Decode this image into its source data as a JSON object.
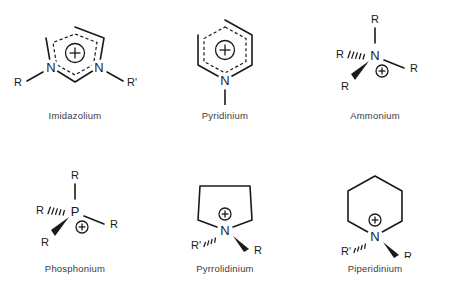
{
  "figure": {
    "background_color": "#ffffff",
    "line_color": "#1a1a1a",
    "caption_color": "#3b3b3b",
    "charge_symbol": "+",
    "columns": 3,
    "rows": 2
  },
  "structures": [
    {
      "id": "imidazolium",
      "caption": "Imidazolium",
      "ring": "five-membered aromatic",
      "heteroatoms": [
        "N",
        "N"
      ],
      "atom_labels": [
        "N",
        "N"
      ],
      "substituents": [
        "R",
        "R'"
      ],
      "charge": "+",
      "charge_position": "ring-center",
      "aromatic_inner_dashed": true
    },
    {
      "id": "pyridinium",
      "caption": "Pyridinium",
      "ring": "six-membered aromatic",
      "heteroatoms": [
        "N"
      ],
      "atom_labels": [
        "N"
      ],
      "substituents": [
        "R"
      ],
      "charge": "+",
      "charge_position": "ring-center",
      "aromatic_inner_dashed": true
    },
    {
      "id": "ammonium",
      "caption": "Ammonium",
      "ring": "none",
      "heteroatoms": [
        "N"
      ],
      "atom_labels": [
        "N"
      ],
      "substituents": [
        "R",
        "R",
        "R",
        "R"
      ],
      "charge": "+",
      "charge_position": "below-right-of-atom",
      "aromatic_inner_dashed": false
    },
    {
      "id": "phosphonium",
      "caption": "Phosphonium",
      "ring": "none",
      "heteroatoms": [
        "P"
      ],
      "atom_labels": [
        "P"
      ],
      "substituents": [
        "R",
        "R",
        "R",
        "R"
      ],
      "charge": "+",
      "charge_position": "below-right-of-atom",
      "aromatic_inner_dashed": false
    },
    {
      "id": "pyrrolidinium",
      "caption": "Pyrrolidinium",
      "ring": "five-membered saturated",
      "heteroatoms": [
        "N"
      ],
      "atom_labels": [
        "N"
      ],
      "substituents": [
        "R'",
        "R"
      ],
      "charge": "+",
      "charge_position": "above-atom",
      "aromatic_inner_dashed": false
    },
    {
      "id": "piperidinium",
      "caption": "Piperidinium",
      "ring": "six-membered saturated",
      "heteroatoms": [
        "N"
      ],
      "atom_labels": [
        "N"
      ],
      "substituents": [
        "R'",
        "R"
      ],
      "charge": "+",
      "charge_position": "above-atom",
      "aromatic_inner_dashed": false
    }
  ]
}
